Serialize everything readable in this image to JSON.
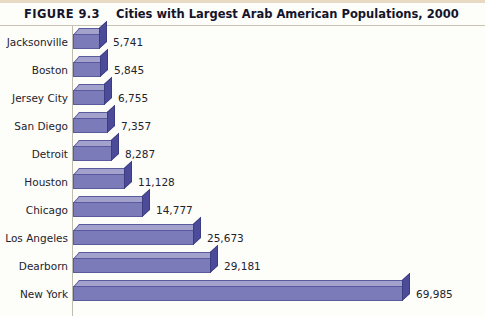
{
  "figure": {
    "number": "FIGURE 9.3",
    "title": "Cities with Largest Arab American Populations, 2000"
  },
  "colors": {
    "bar_front": "#7b7bba",
    "bar_top": "#a2a2cd",
    "bar_side": "#4b4b9a",
    "background": "#fdfdfa",
    "text": "#23232c",
    "title_text": "#14142b",
    "top_rule": "#e8d9c2"
  },
  "chart_data": {
    "type": "bar",
    "orientation": "horizontal",
    "title": "Cities with Largest Arab American Populations, 2000",
    "xlabel": "",
    "ylabel": "",
    "grid": false,
    "legend": "none",
    "xlim": [
      0,
      69985
    ],
    "categories": [
      "Jacksonville",
      "Boston",
      "Jersey City",
      "San Diego",
      "Detroit",
      "Houston",
      "Chicago",
      "Los Angeles",
      "Dearborn",
      "New York"
    ],
    "values": [
      5741,
      5845,
      6755,
      7357,
      8287,
      11128,
      14777,
      25673,
      29181,
      69985
    ],
    "value_labels": [
      "5,741",
      "5,845",
      "6,755",
      "7,357",
      "8,287",
      "11,128",
      "14,777",
      "25,673",
      "29,181",
      "69,985"
    ]
  }
}
